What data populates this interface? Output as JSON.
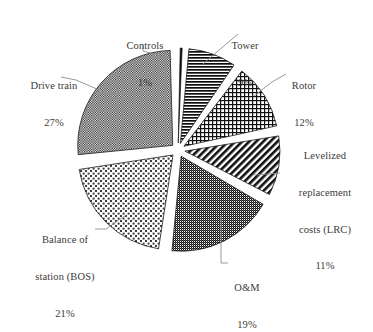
{
  "chart_data": {
    "type": "pie",
    "title": "",
    "subtitle": "",
    "xlabel": "",
    "ylabel": "",
    "legend_position": "labels-with-leader-lines",
    "grid": false,
    "exploded": true,
    "units": "percent",
    "categories": [
      "Controls",
      "Tower",
      "Rotor",
      "Levelized replacement costs (LRC)",
      "O&M",
      "Balance of station (BOS)",
      "Drive train"
    ],
    "values": [
      1,
      9,
      12,
      11,
      19,
      21,
      27
    ],
    "slices": [
      {
        "name": "Controls",
        "label_lines": [
          "Controls"
        ],
        "value": 1,
        "pct_text": "1%",
        "pattern": "solid-black",
        "fill": "#101010",
        "start_deg": 0,
        "sweep_deg": 3.6
      },
      {
        "name": "Tower",
        "label_lines": [
          "Tower"
        ],
        "value": 9,
        "pct_text": "9%",
        "pattern": "horizontal-lines",
        "fill": "#1a1a1a",
        "start_deg": 3.6,
        "sweep_deg": 32.4
      },
      {
        "name": "Rotor",
        "label_lines": [
          "Rotor"
        ],
        "value": 12,
        "pct_text": "12%",
        "pattern": "grid-crosshatch",
        "fill": "#262626",
        "start_deg": 36.0,
        "sweep_deg": 43.2
      },
      {
        "name": "Levelized replacement costs (LRC)",
        "label_lines": [
          "Levelized",
          "replacement",
          "costs (LRC)"
        ],
        "value": 11,
        "pct_text": "11%",
        "pattern": "diagonal-stripes",
        "fill": "#1c1c1c",
        "start_deg": 79.2,
        "sweep_deg": 39.6
      },
      {
        "name": "O&M",
        "label_lines": [
          "O&M"
        ],
        "value": 19,
        "pct_text": "19%",
        "pattern": "dense-dither",
        "fill": "#3b3b3b",
        "start_deg": 118.8,
        "sweep_deg": 68.4
      },
      {
        "name": "Balance of station (BOS)",
        "label_lines": [
          "Balance of",
          "station (BOS)"
        ],
        "value": 21,
        "pct_text": "21%",
        "pattern": "light-basket-dots",
        "fill": "#8d8d8d",
        "start_deg": 187.2,
        "sweep_deg": 75.6
      },
      {
        "name": "Drive train",
        "label_lines": [
          "Drive train"
        ],
        "value": 27,
        "pct_text": "27%",
        "pattern": "medium-checkerboard",
        "fill": "#646464",
        "start_deg": 262.8,
        "sweep_deg": 97.2
      }
    ]
  },
  "labels": {
    "controls": {
      "name": "Controls",
      "pct": "1%"
    },
    "tower": {
      "name": "Tower",
      "pct": "9%"
    },
    "rotor": {
      "name": "Rotor",
      "pct": "12%"
    },
    "lrc": {
      "line1": "Levelized",
      "line2": "replacement",
      "line3": "costs (LRC)",
      "pct": "11%"
    },
    "om": {
      "name": "O&M",
      "pct": "19%"
    },
    "bos": {
      "line1": "Balance of",
      "line2": "station (BOS)",
      "pct": "21%"
    },
    "drive": {
      "name": "Drive train",
      "pct": "27%"
    }
  },
  "colors": {
    "background": "#ffffff",
    "text": "#3d3b39",
    "leader_line": "#8b8b8b",
    "slice_outline": "#2a2a2a"
  }
}
